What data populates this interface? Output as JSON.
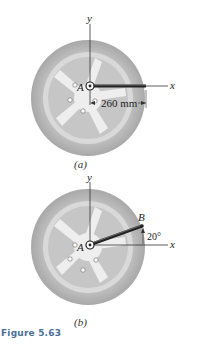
{
  "figure": {
    "title": "Figure 5.63",
    "accent_color": "#4a6e9c",
    "panels": [
      {
        "id": "a",
        "caption": "(a)",
        "point_label": "A",
        "axis_x_label": "x",
        "axis_y_label": "y",
        "dimension_label": "260 mm",
        "wrench_angle_deg": 0
      },
      {
        "id": "b",
        "caption": "(b)",
        "point_label_A": "A",
        "point_label_B": "B",
        "axis_x_label": "x",
        "axis_y_label": "y",
        "angle_label": "20°",
        "wrench_angle_deg": 20
      }
    ]
  }
}
